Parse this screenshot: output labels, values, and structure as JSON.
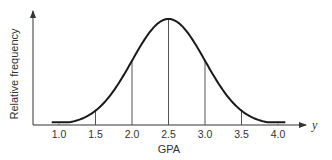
{
  "chart_data": {
    "type": "line",
    "title": "",
    "xlabel": "GPA",
    "ylabel": "Relative frequency",
    "x_axis_variable": "y",
    "x_ticks": [
      "1.0",
      "1.5",
      "2.0",
      "2.5",
      "3.0",
      "3.5",
      "4.0"
    ],
    "xlim": [
      0.65,
      4.4
    ],
    "ylim": [
      0,
      1.1
    ],
    "grid": false,
    "legend": null,
    "y_ticks_shown": false,
    "series": [
      {
        "name": "Distribution of GPA",
        "shape": "bell (normal) curve",
        "mean": 2.5,
        "x": [
          0.9,
          1.0,
          1.25,
          1.5,
          1.75,
          2.0,
          2.25,
          2.5,
          2.75,
          3.0,
          3.25,
          3.5,
          3.75,
          4.0,
          4.1
        ],
        "values": [
          0.03,
          0.04,
          0.09,
          0.17,
          0.33,
          0.58,
          0.88,
          1.0,
          0.88,
          0.58,
          0.33,
          0.17,
          0.09,
          0.04,
          0.03
        ]
      }
    ],
    "vertical_lines_at": [
      1.5,
      2.0,
      2.5,
      3.0,
      3.5
    ],
    "small_ticks_at": [
      1.0,
      4.0
    ]
  },
  "labels": {
    "ylabel": "Relative frequency",
    "xlabel": "GPA",
    "var": "y"
  },
  "colors": {
    "curve": "#1a1a1a",
    "axis": "#333333",
    "lines": "#555555"
  }
}
